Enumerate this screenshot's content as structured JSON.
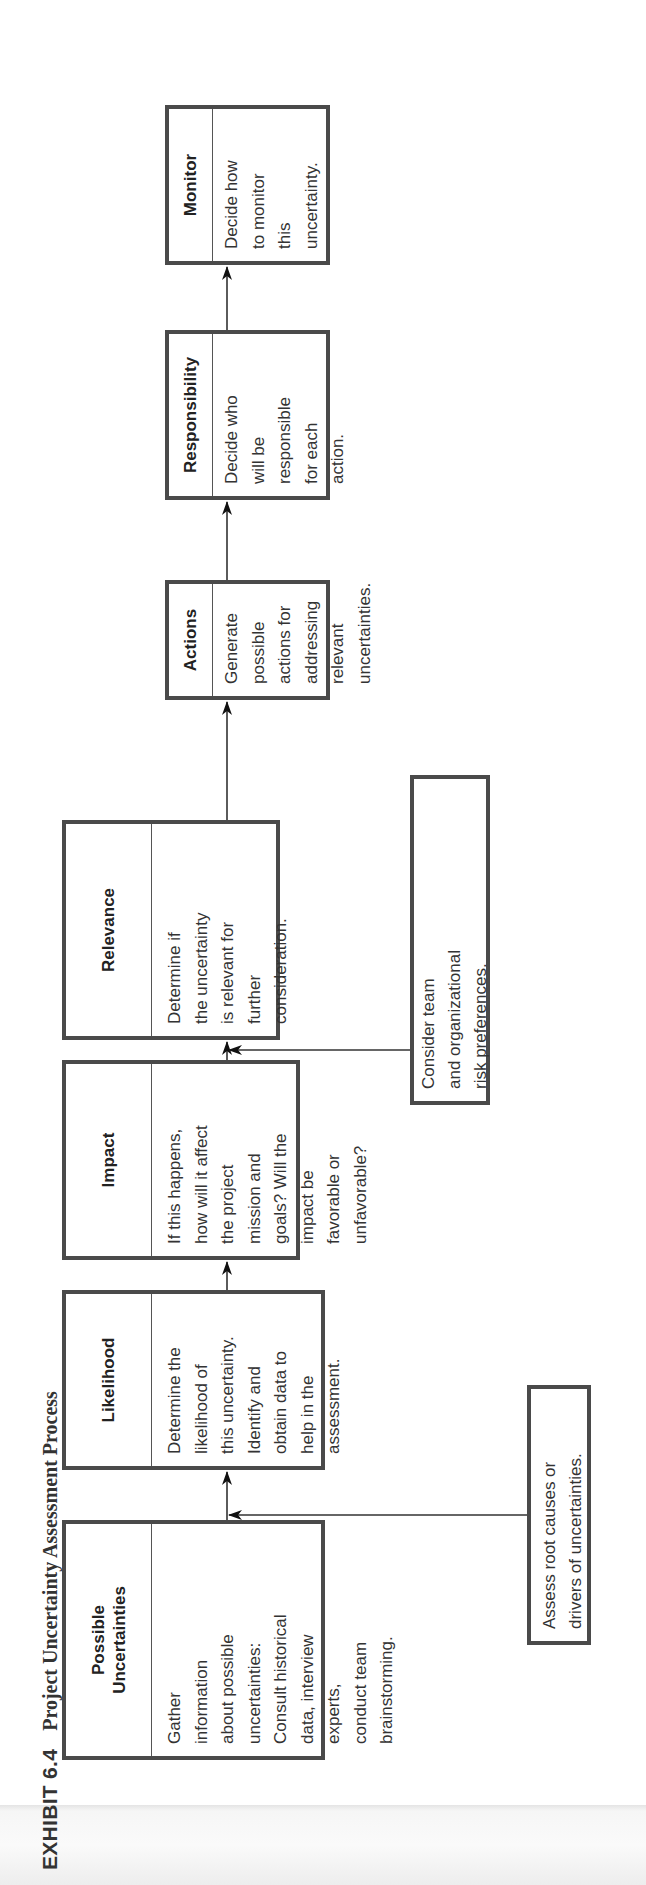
{
  "exhibit": {
    "number": "EXHIBIT 6.4",
    "title": "Project Uncertainty Assessment Process"
  },
  "steps": [
    {
      "title": "Possible\nUncertainties",
      "body": "Gather\ninformation\nabout possible\nuncertainties:\nConsult historical\ndata, interview\nexperts,\nconduct team\nbrainstorming."
    },
    {
      "title": "Likelihood",
      "body": "Determine the\nlikelihood of\nthis uncertainty.\nIdentify and\nobtain data to\nhelp in the\nassessment."
    },
    {
      "title": "Impact",
      "body": "If this happens,\nhow will it affect\nthe project\nmission and\ngoals? Will the\nimpact be\nfavorable or\nunfavorable?"
    },
    {
      "title": "Relevance",
      "body": "Determine if\nthe uncertainty\nis relevant for\nfurther\nconsideration."
    },
    {
      "title": "Actions",
      "body": "Generate\npossible\nactions for\naddressing\nrelevant\nuncertainties."
    },
    {
      "title": "Responsibility",
      "body": "Decide who\nwill be\nresponsible\nfor each\naction."
    },
    {
      "title": "Monitor",
      "body": "Decide how\nto monitor\nthis\nuncertainty."
    }
  ],
  "inputs": [
    {
      "text": "Assess root causes or\ndrivers of uncertainties.",
      "feeds_into": "Likelihood"
    },
    {
      "text": "Consider team\nand organizational\nrisk preferences.",
      "feeds_into": "Relevance"
    }
  ],
  "colors": {
    "border": "#4a4a4a",
    "text": "#333333",
    "background": "#ffffff"
  }
}
